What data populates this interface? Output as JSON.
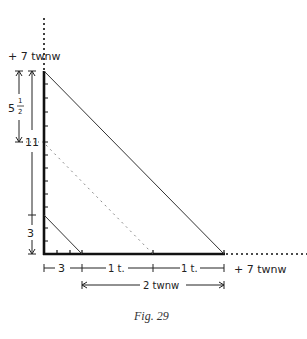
{
  "figure": {
    "caption": "Fig. 29",
    "top_label": "+ 7 twnw",
    "right_label": "+ 7 twnw",
    "vertical_labels": {
      "upper_dimension": "5",
      "upper_fraction_num": "1",
      "upper_fraction_den": "2",
      "mid_mark": "11",
      "lower_dimension": "3"
    },
    "horizontal_labels": {
      "seg1": "3",
      "seg2": "1 t.",
      "seg3": "1 t.",
      "span": "2 twnw"
    },
    "colors": {
      "axis": "#111111",
      "line": "#333333",
      "dotted": "#888888"
    }
  }
}
